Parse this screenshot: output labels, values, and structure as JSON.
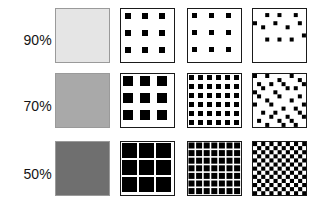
{
  "figure": {
    "background": "#ffffff",
    "ink_color": "#000000",
    "border_color_solid": "#9a9a9a",
    "border_color_pattern": "#1a1a1a",
    "swatch_size": 55,
    "columns": [
      {
        "key": "solid",
        "name": "solid-tone",
        "x": 55
      },
      {
        "key": "coarse_am",
        "name": "coarse-am-halftone",
        "x": 120
      },
      {
        "key": "fine_am",
        "name": "fine-am-halftone",
        "x": 187
      },
      {
        "key": "stochastic",
        "name": "stochastic-screen",
        "x": 252
      }
    ],
    "rows": [
      {
        "label": "90%",
        "value": 90,
        "y": 8,
        "label_y": 33,
        "gray": "#e5e5e5"
      },
      {
        "label": "70%",
        "value": 70,
        "y": 73,
        "label_y": 99,
        "gray": "#a9a9a9"
      },
      {
        "label": "50%",
        "value": 50,
        "y": 141,
        "label_y": 167,
        "gray": "#6f6f6f"
      }
    ]
  },
  "chart_data": {
    "type": "table",
    "title": "",
    "xlabel": "",
    "ylabel": "",
    "row_headers": [
      "90%",
      "70%",
      "50%"
    ],
    "column_headers": [
      "solid tone",
      "coarse AM halftone",
      "fine AM halftone",
      "stochastic screen"
    ],
    "cells": [
      {
        "row": "90%",
        "column": "solid tone",
        "render": "solid",
        "fill": "#e5e5e5",
        "coverage_percent": 10
      },
      {
        "row": "90%",
        "column": "coarse AM halftone",
        "render": "grid",
        "cells_x": 3,
        "cells_y": 3,
        "dot_size": 6,
        "pitch": 17,
        "offset": 4,
        "coverage_percent": 11
      },
      {
        "row": "90%",
        "column": "fine AM halftone",
        "render": "grid",
        "cells_x": 3,
        "cells_y": 3,
        "dot_size": 5,
        "pitch": 17,
        "offset": 4,
        "coverage_percent": 9
      },
      {
        "row": "90%",
        "column": "stochastic screen",
        "render": "stochastic",
        "dot_size": 4,
        "grid": 13,
        "coverage_percent": 10,
        "dots": [
          [
            3,
            1
          ],
          [
            6,
            1
          ],
          [
            10,
            1
          ],
          [
            0,
            3
          ],
          [
            2,
            4
          ],
          [
            5,
            3
          ],
          [
            8,
            4
          ],
          [
            11,
            3
          ],
          [
            3,
            7
          ],
          [
            6,
            7
          ],
          [
            9,
            7
          ],
          [
            12,
            6
          ]
        ]
      },
      {
        "row": "70%",
        "column": "solid tone",
        "render": "solid",
        "fill": "#a9a9a9",
        "coverage_percent": 30
      },
      {
        "row": "70%",
        "column": "coarse AM halftone",
        "render": "grid",
        "cells_x": 3,
        "cells_y": 3,
        "dot_size": 10,
        "pitch": 17,
        "offset": 2,
        "coverage_percent": 31
      },
      {
        "row": "70%",
        "column": "fine AM halftone",
        "render": "grid",
        "cells_x": 6,
        "cells_y": 6,
        "dot_size": 5,
        "pitch": 9,
        "offset": 1,
        "coverage_percent": 30
      },
      {
        "row": "70%",
        "column": "stochastic screen",
        "render": "stochastic",
        "dot_size": 4,
        "grid": 13,
        "coverage_percent": 30,
        "dots": [
          [
            0,
            0
          ],
          [
            3,
            0
          ],
          [
            6,
            1
          ],
          [
            9,
            0
          ],
          [
            11,
            1
          ],
          [
            1,
            2
          ],
          [
            4,
            2
          ],
          [
            7,
            2
          ],
          [
            10,
            3
          ],
          [
            12,
            2
          ],
          [
            0,
            4
          ],
          [
            2,
            3
          ],
          [
            5,
            4
          ],
          [
            8,
            3
          ],
          [
            11,
            5
          ],
          [
            1,
            5
          ],
          [
            3,
            6
          ],
          [
            6,
            5
          ],
          [
            9,
            6
          ],
          [
            12,
            7
          ],
          [
            0,
            7
          ],
          [
            4,
            7
          ],
          [
            7,
            8
          ],
          [
            10,
            8
          ],
          [
            2,
            9
          ],
          [
            5,
            9
          ],
          [
            8,
            10
          ],
          [
            11,
            9
          ],
          [
            1,
            11
          ],
          [
            4,
            10
          ],
          [
            6,
            11
          ],
          [
            9,
            11
          ],
          [
            12,
            10
          ],
          [
            3,
            12
          ],
          [
            7,
            12
          ],
          [
            10,
            12
          ]
        ]
      },
      {
        "row": "50%",
        "column": "solid tone",
        "render": "solid",
        "fill": "#6f6f6f",
        "coverage_percent": 50
      },
      {
        "row": "50%",
        "column": "coarse AM halftone",
        "render": "grid",
        "cells_x": 3,
        "cells_y": 3,
        "dot_size": 15,
        "pitch": 17,
        "offset": 1,
        "coverage_percent": 52
      },
      {
        "row": "50%",
        "column": "fine AM halftone",
        "render": "grid",
        "cells_x": 7,
        "cells_y": 7,
        "dot_size": 6,
        "pitch": 7.6,
        "offset": 0.5,
        "coverage_percent": 50
      },
      {
        "row": "50%",
        "column": "stochastic screen",
        "render": "checkerboard",
        "cells_x": 13,
        "cells_y": 13,
        "cell_size": 4.1,
        "coverage_percent": 50
      }
    ]
  }
}
